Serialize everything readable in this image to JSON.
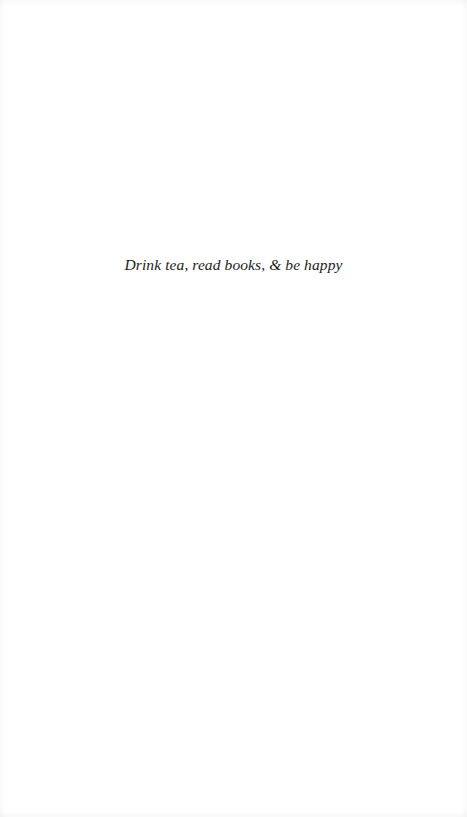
{
  "page": {
    "epigraph": "Drink tea, read books, & be happy"
  }
}
